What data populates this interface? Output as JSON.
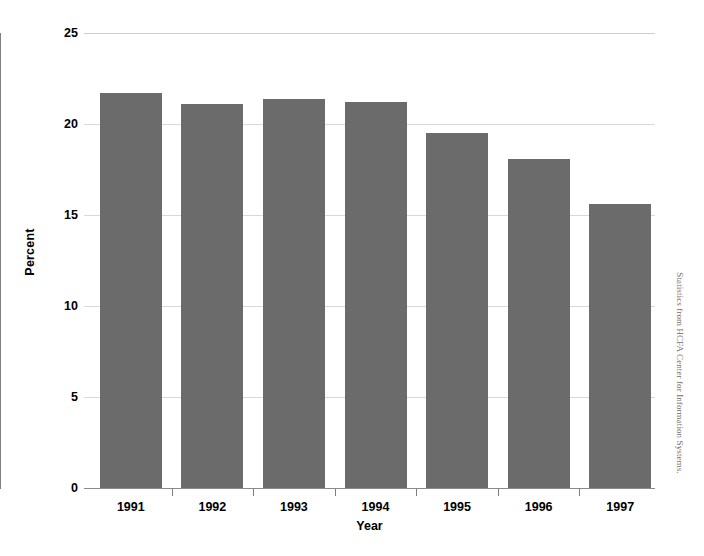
{
  "chart_data": {
    "type": "bar",
    "title": "",
    "subtitle": "",
    "xlabel": "Year",
    "ylabel": "Percent",
    "categories": [
      "1991",
      "1992",
      "1993",
      "1994",
      "1995",
      "1996",
      "1997"
    ],
    "values": [
      21.7,
      21.1,
      21.4,
      21.2,
      19.5,
      18.1,
      15.6
    ],
    "ylim": [
      0,
      25
    ],
    "ytick_labels": [
      "0",
      "5",
      "10",
      "15",
      "20",
      "25"
    ],
    "ytick_values": [
      0,
      5,
      10,
      15,
      20,
      25
    ],
    "grid": "horizontal",
    "legend": "none",
    "bar_color": "#6b6b6b",
    "gridline_color": "#d9d9d9",
    "axis_color": "#808080",
    "background_color": "#ffffff",
    "annotations": [
      "Statistics from HCFA Center for Information Systems."
    ]
  },
  "figure": {
    "source_note": "Statistics from HCFA Center for Information Systems."
  }
}
